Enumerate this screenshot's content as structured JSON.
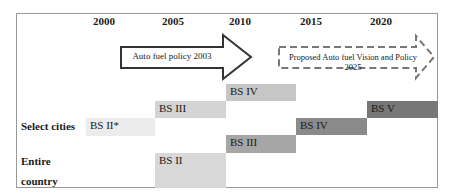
{
  "years": [
    "2000",
    "2005",
    "2010",
    "2015",
    "2020"
  ],
  "row_labels": {
    "select_cities": "Select cities",
    "entire_line1": "Entire",
    "entire_line2": "country"
  },
  "policies": {
    "current": "Auto fuel policy 2003",
    "proposed": "Proposed Auto fuel Vision and Policy 2025"
  },
  "blocks": {
    "cities_bs2": {
      "label": "BS II*",
      "color": "#ececec"
    },
    "cities_bs3": {
      "label": "BS III",
      "color": "#d4d4d4"
    },
    "cities_bs4": {
      "label": "BS IV",
      "color": "#c6c6c6"
    },
    "bs5": {
      "label": "BS V",
      "color": "#777777"
    },
    "entire_bs4": {
      "label": "BS IV",
      "color": "#8a8a8a"
    },
    "entire_bs3": {
      "label": "BS III",
      "color": "#a6a6a6"
    },
    "entire_bs2": {
      "label": "BS II",
      "color": "#d8d8d8"
    }
  }
}
